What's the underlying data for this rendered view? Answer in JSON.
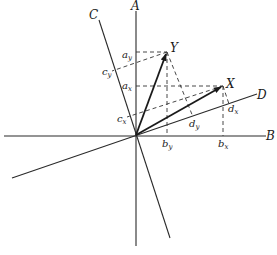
{
  "diagram": {
    "axes": [
      {
        "name": "A",
        "label": "A"
      },
      {
        "name": "B",
        "label": "B"
      },
      {
        "name": "C",
        "label": "C"
      },
      {
        "name": "D",
        "label": "D"
      }
    ],
    "vectors": [
      {
        "name": "X",
        "label": "X"
      },
      {
        "name": "Y",
        "label": "Y"
      }
    ],
    "components": {
      "a_y": {
        "base": "a",
        "sub": "y"
      },
      "a_x": {
        "base": "a",
        "sub": "x"
      },
      "c_y": {
        "base": "c",
        "sub": "y"
      },
      "c_x": {
        "base": "c",
        "sub": "x"
      },
      "b_y": {
        "base": "b",
        "sub": "y"
      },
      "b_x": {
        "base": "b",
        "sub": "x"
      },
      "d_y": {
        "base": "d",
        "sub": "y"
      },
      "d_x": {
        "base": "d",
        "sub": "x"
      }
    }
  }
}
